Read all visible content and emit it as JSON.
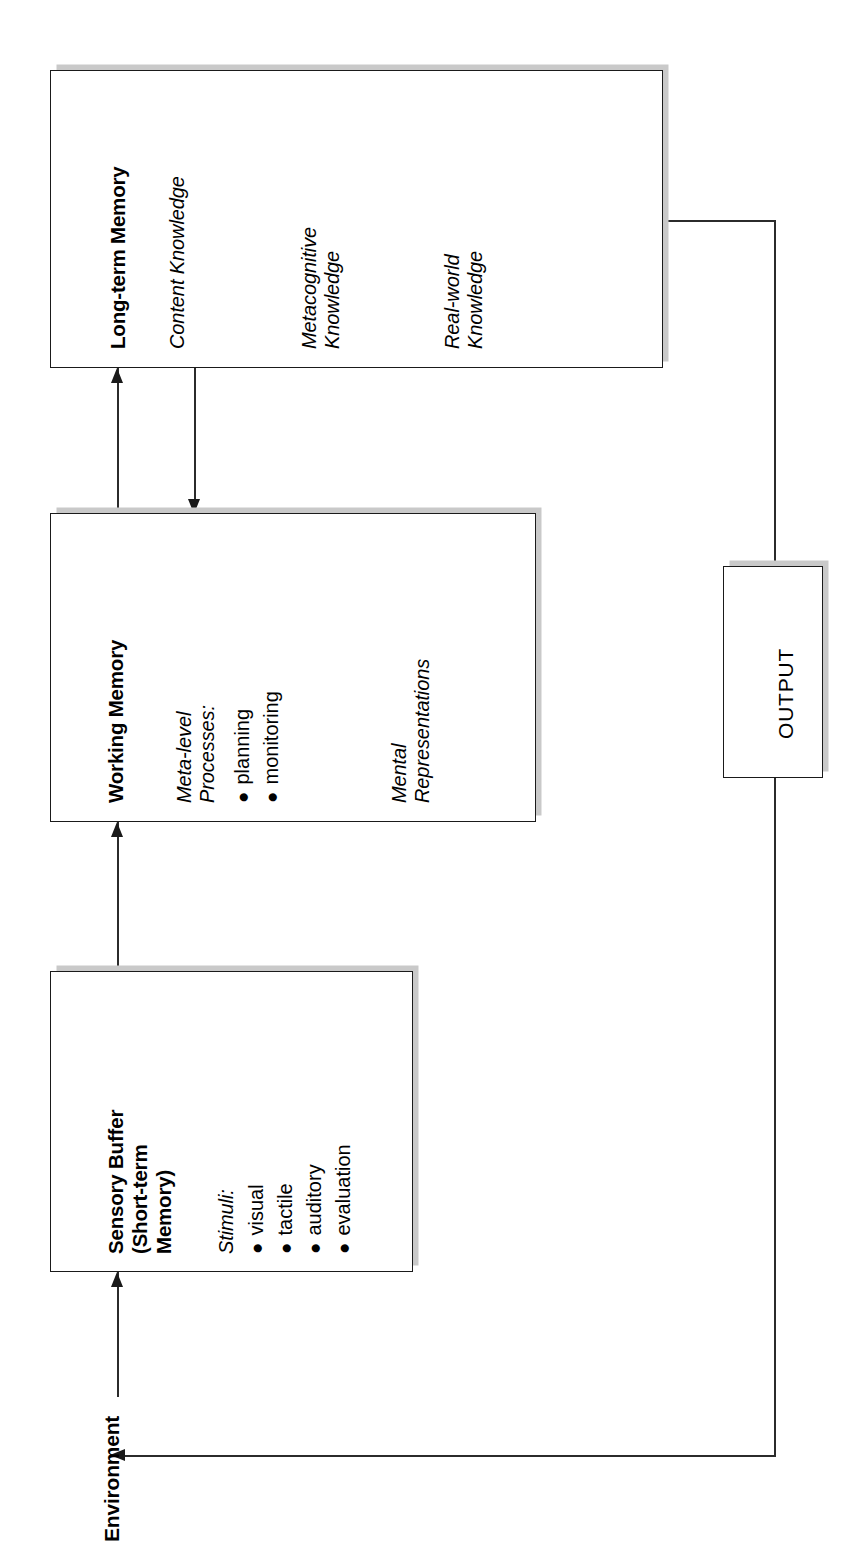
{
  "diagram": {
    "title_hidden": "Model of memory and cognitive processing",
    "orientation_note": "rotated-90-ccw"
  },
  "environment": {
    "label": "Environment"
  },
  "boxes": {
    "long_term_memory": {
      "title": "Long-term Memory",
      "items": [
        "Content Knowledge",
        "Metacognitive\nKnowledge",
        "Real-world\nKnowledge"
      ],
      "item_1": "Content Knowledge",
      "item_2_line1": "Metacognitive",
      "item_2_line2": "Knowledge",
      "item_3_line1": "Real-world",
      "item_3_line2": "Knowledge"
    },
    "working_memory": {
      "title": "Working Memory",
      "section_1_line1": "Meta-level",
      "section_1_line2": "Processes:",
      "bullets": [
        "planning",
        "monitoring"
      ],
      "bullet_1": "planning",
      "bullet_2": "monitoring",
      "section_2_line1": "Mental",
      "section_2_line2": "Representations"
    },
    "sensory_buffer": {
      "title_line1": "Sensory Buffer",
      "title_line2": "(Short-term",
      "title_line3": "Memory)",
      "section_1": "Stimuli:",
      "bullets": [
        "visual",
        "tactile",
        "auditory",
        "evaluation"
      ],
      "bullet_1": "visual",
      "bullet_2": "tactile",
      "bullet_3": "auditory",
      "bullet_4": "evaluation"
    },
    "output": {
      "label": "OUTPUT"
    }
  },
  "connections": [
    {
      "from": "Environment",
      "to": "Sensory Buffer",
      "arrow": "single"
    },
    {
      "from": "Sensory Buffer",
      "to": "Working Memory",
      "arrow": "single"
    },
    {
      "from": "Working Memory",
      "to": "Long-term Memory",
      "arrow": "single-up"
    },
    {
      "from": "Long-term Memory",
      "to": "Working Memory",
      "arrow": "single-down"
    },
    {
      "from": "Long-term Memory",
      "to": "OUTPUT",
      "arrow": "none"
    },
    {
      "from": "OUTPUT",
      "to": "Environment",
      "arrow": "single-left"
    }
  ],
  "colors": {
    "stroke": "#1a1a1a",
    "shadow": "#c9c9c9",
    "background": "#ffffff"
  },
  "bullet_glyph": "●"
}
